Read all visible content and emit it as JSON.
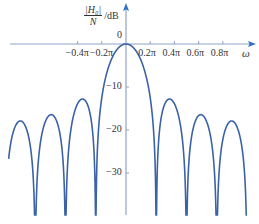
{
  "chart_data": {
    "type": "line",
    "title": "",
    "xlabel": "ω",
    "ylabel_numerator": "|H₀|",
    "ylabel_denominator": "N",
    "ylabel_unit": "/dB",
    "x_tick_labels": [
      "−0.4π",
      "−0.2π",
      "0.2π",
      "0.4π",
      "0.6π",
      "0.8π"
    ],
    "x_tick_values_pi": [
      -0.4,
      -0.2,
      0.2,
      0.4,
      0.6,
      0.8
    ],
    "y_tick_labels": [
      "0",
      "−10",
      "−20",
      "−30"
    ],
    "y_tick_values": [
      0,
      -10,
      -20,
      -30
    ],
    "xlim_pi": [
      -0.97,
      1.0
    ],
    "ylim": [
      -39,
      3
    ],
    "grid": false,
    "legend": null,
    "N": 8,
    "mainlobe_peak_db": 0,
    "null_positions_pi": [
      -1.0,
      -0.75,
      -0.5,
      -0.25,
      0.25,
      0.5,
      0.75,
      1.0
    ],
    "sidelobe_peaks": [
      {
        "x_pi": -0.875,
        "db": -20.5
      },
      {
        "x_pi": -0.625,
        "db": -18.6
      },
      {
        "x_pi": -0.375,
        "db": -14.5
      },
      {
        "x_pi": 0.375,
        "db": -14.5
      },
      {
        "x_pi": 0.625,
        "db": -18.6
      },
      {
        "x_pi": 0.875,
        "db": -20.5
      }
    ]
  },
  "colors": {
    "curve": "#3a62a7",
    "axis": "#8fa3c8",
    "arrow": "#2f6fc4",
    "text": "#333333"
  },
  "labels": {
    "zero": "0",
    "omega": "ω"
  }
}
